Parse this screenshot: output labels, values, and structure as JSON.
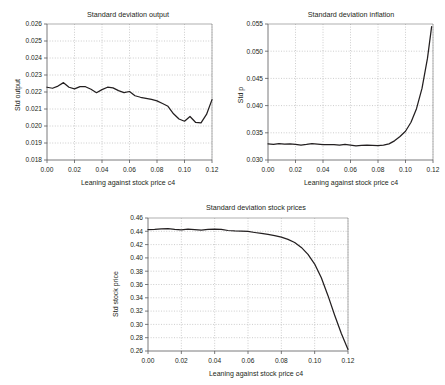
{
  "figure": {
    "background": "#ffffff",
    "line_color": "#231f20",
    "grid_color": "#9a9a9a"
  },
  "chart_data": [
    {
      "id": "output",
      "type": "line",
      "title": "Standard deviation output",
      "xlabel": "Leaning against stock price c4",
      "ylabel": "Std output",
      "xlim": [
        0.0,
        0.12
      ],
      "ylim": [
        0.018,
        0.026
      ],
      "grid": true,
      "legend": "none",
      "xticks": [
        0.0,
        0.02,
        0.04,
        0.06,
        0.08,
        0.1,
        0.12
      ],
      "xticklabels": [
        "0.00",
        "0.02",
        "0.04",
        "0.06",
        "0.08",
        "0.10",
        "0.12"
      ],
      "yticks": [
        0.018,
        0.019,
        0.02,
        0.021,
        0.022,
        0.023,
        0.024,
        0.025,
        0.026
      ],
      "yticklabels": [
        "0.018",
        "0.019",
        "0.020",
        "0.021",
        "0.022",
        "0.023",
        "0.024",
        "0.025",
        "0.026"
      ],
      "x": [
        0.0,
        0.004,
        0.008,
        0.012,
        0.016,
        0.02,
        0.024,
        0.028,
        0.032,
        0.036,
        0.04,
        0.044,
        0.048,
        0.052,
        0.056,
        0.06,
        0.064,
        0.068,
        0.072,
        0.076,
        0.08,
        0.084,
        0.088,
        0.092,
        0.096,
        0.1,
        0.104,
        0.108,
        0.112,
        0.116,
        0.12
      ],
      "y": [
        0.02228,
        0.02222,
        0.02235,
        0.02255,
        0.02228,
        0.02218,
        0.02232,
        0.02231,
        0.02216,
        0.02196,
        0.02214,
        0.02228,
        0.02224,
        0.02208,
        0.02196,
        0.02203,
        0.02178,
        0.02169,
        0.02163,
        0.02156,
        0.02148,
        0.02132,
        0.02116,
        0.02072,
        0.02041,
        0.02028,
        0.02056,
        0.02022,
        0.02018,
        0.02068,
        0.02155
      ]
    },
    {
      "id": "inflation",
      "type": "line",
      "title": "Standard deviation inflation",
      "xlabel": "Leaning against stock price c4",
      "ylabel": "Std p",
      "xlim": [
        0.0,
        0.12
      ],
      "ylim": [
        0.03,
        0.055
      ],
      "grid": true,
      "legend": "none",
      "xticks": [
        0.0,
        0.02,
        0.04,
        0.06,
        0.08,
        0.1,
        0.12
      ],
      "xticklabels": [
        "0.00",
        "0.02",
        "0.04",
        "0.06",
        "0.08",
        "0.10",
        "0.12"
      ],
      "yticks": [
        0.03,
        0.035,
        0.04,
        0.045,
        0.05,
        0.055
      ],
      "yticklabels": [
        "0.030",
        "0.035",
        "0.040",
        "0.045",
        "0.050",
        "0.055"
      ],
      "x": [
        0.0,
        0.004,
        0.008,
        0.012,
        0.016,
        0.02,
        0.024,
        0.028,
        0.032,
        0.036,
        0.04,
        0.044,
        0.048,
        0.052,
        0.056,
        0.06,
        0.064,
        0.068,
        0.072,
        0.076,
        0.08,
        0.084,
        0.088,
        0.092,
        0.096,
        0.1,
        0.104,
        0.108,
        0.112,
        0.116,
        0.119
      ],
      "y": [
        0.03296,
        0.03288,
        0.03302,
        0.03292,
        0.03296,
        0.03287,
        0.03272,
        0.03286,
        0.03303,
        0.03292,
        0.03281,
        0.03282,
        0.03284,
        0.03273,
        0.03288,
        0.03272,
        0.03258,
        0.03268,
        0.03272,
        0.03268,
        0.03264,
        0.03272,
        0.03296,
        0.03352,
        0.03432,
        0.03528,
        0.03694,
        0.03944,
        0.04316,
        0.04872,
        0.05452
      ]
    },
    {
      "id": "stock",
      "type": "line",
      "title": "Standard deviation stock prices",
      "xlabel": "Leaning against stock price c4",
      "ylabel": "Std stock price",
      "xlim": [
        0.0,
        0.12
      ],
      "ylim": [
        0.26,
        0.46
      ],
      "grid": true,
      "legend": "none",
      "xticks": [
        0.0,
        0.02,
        0.04,
        0.06,
        0.08,
        0.1,
        0.12
      ],
      "xticklabels": [
        "0.00",
        "0.02",
        "0.04",
        "0.06",
        "0.08",
        "0.10",
        "0.12"
      ],
      "yticks": [
        0.26,
        0.28,
        0.3,
        0.32,
        0.34,
        0.36,
        0.38,
        0.4,
        0.42,
        0.44,
        0.46
      ],
      "yticklabels": [
        "0.26",
        "0.28",
        "0.30",
        "0.32",
        "0.34",
        "0.36",
        "0.38",
        "0.40",
        "0.42",
        "0.44",
        "0.46"
      ],
      "x": [
        0.0,
        0.004,
        0.008,
        0.012,
        0.016,
        0.02,
        0.024,
        0.028,
        0.032,
        0.036,
        0.04,
        0.044,
        0.048,
        0.052,
        0.056,
        0.06,
        0.064,
        0.068,
        0.072,
        0.076,
        0.08,
        0.084,
        0.088,
        0.092,
        0.096,
        0.1,
        0.104,
        0.108,
        0.112,
        0.116,
        0.12
      ],
      "y": [
        0.4425,
        0.4428,
        0.4438,
        0.4442,
        0.4428,
        0.4422,
        0.4432,
        0.4426,
        0.4418,
        0.4428,
        0.4434,
        0.4428,
        0.4412,
        0.4406,
        0.4404,
        0.4398,
        0.4382,
        0.4368,
        0.4352,
        0.4334,
        0.4312,
        0.4278,
        0.4232,
        0.4158,
        0.4052,
        0.3908,
        0.3702,
        0.3432,
        0.3138,
        0.2862,
        0.2622
      ]
    }
  ]
}
